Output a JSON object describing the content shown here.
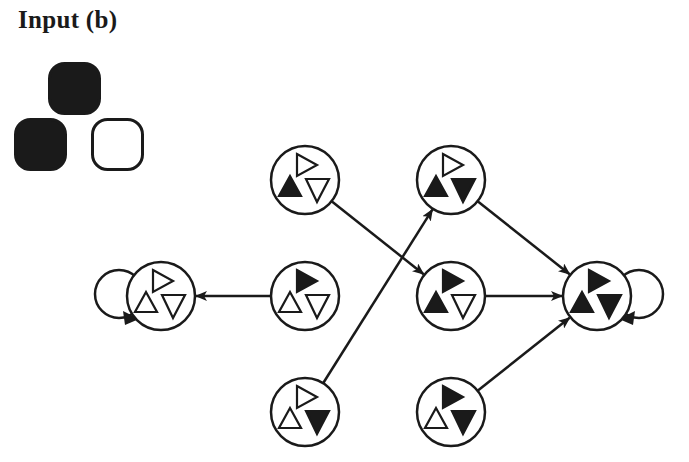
{
  "title": "Input (b)",
  "colors": {
    "ink": "#1a1a1a",
    "background": "#ffffff"
  },
  "input_pattern": [
    {
      "position": "top",
      "filled": true
    },
    {
      "position": "bottom-left",
      "filled": true
    },
    {
      "position": "bottom-right",
      "filled": false
    }
  ],
  "nodes": [
    {
      "id": "n0",
      "cx": 161,
      "cy": 296,
      "right": false,
      "up": false,
      "down": false,
      "self_loop": "left"
    },
    {
      "id": "n1",
      "cx": 305,
      "cy": 180,
      "right": false,
      "up": true,
      "down": false
    },
    {
      "id": "n2",
      "cx": 305,
      "cy": 296,
      "right": true,
      "up": false,
      "down": false
    },
    {
      "id": "n3",
      "cx": 305,
      "cy": 412,
      "right": false,
      "up": false,
      "down": true
    },
    {
      "id": "n4",
      "cx": 451,
      "cy": 180,
      "right": false,
      "up": true,
      "down": true
    },
    {
      "id": "n5",
      "cx": 451,
      "cy": 296,
      "right": true,
      "up": true,
      "down": false
    },
    {
      "id": "n6",
      "cx": 451,
      "cy": 412,
      "right": true,
      "up": false,
      "down": true
    },
    {
      "id": "n7",
      "cx": 597,
      "cy": 296,
      "right": true,
      "up": true,
      "down": true,
      "self_loop": "right"
    }
  ],
  "edges": [
    {
      "from": "n2",
      "to": "n0"
    },
    {
      "from": "n1",
      "to": "n5"
    },
    {
      "from": "n3",
      "to": "n4"
    },
    {
      "from": "n4",
      "to": "n7"
    },
    {
      "from": "n5",
      "to": "n7"
    },
    {
      "from": "n6",
      "to": "n7"
    }
  ]
}
